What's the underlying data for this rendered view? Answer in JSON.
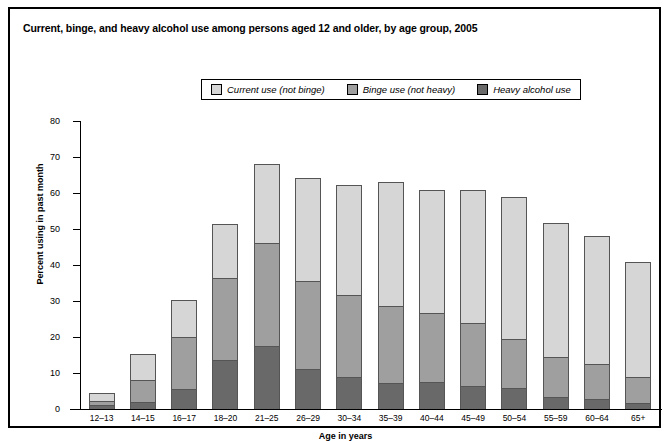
{
  "title": "Current, binge, and heavy alcohol use among persons aged 12 and older, by age group, 2005",
  "legend": {
    "entries": [
      {
        "label": "Current use (not binge)",
        "color": "#d6d6d6",
        "icon": "legend-swatch-icon"
      },
      {
        "label": "Binge use (not heavy)",
        "color": "#9f9f9f",
        "icon": "legend-swatch-icon"
      },
      {
        "label": "Heavy alcohol use",
        "color": "#696969",
        "icon": "legend-swatch-icon"
      }
    ]
  },
  "chart_data": {
    "type": "bar",
    "stacked": true,
    "title": "Current, binge, and heavy alcohol use among persons aged 12 and older, by age group, 2005",
    "xlabel": "Age in years",
    "ylabel": "Percent using in past month",
    "ylim": [
      0,
      80
    ],
    "yticks": [
      0,
      10,
      20,
      30,
      40,
      50,
      60,
      70,
      80
    ],
    "grid": false,
    "legend_position": "top-center",
    "categories": [
      "12–13",
      "14–15",
      "16–17",
      "18–20",
      "21–25",
      "26–29",
      "30–34",
      "35–39",
      "40–44",
      "45–49",
      "50–54",
      "55–59",
      "60–64",
      "65+"
    ],
    "series": [
      {
        "name": "Heavy alcohol use",
        "color": "#696969",
        "values": [
          1.1,
          2.0,
          5.6,
          13.6,
          17.4,
          11.1,
          9.0,
          7.2,
          7.6,
          6.4,
          5.9,
          3.3,
          2.7,
          1.7
        ]
      },
      {
        "name": "Binge use (not heavy)",
        "color": "#9f9f9f",
        "values": [
          1.2,
          6.0,
          14.3,
          22.8,
          28.8,
          24.4,
          22.6,
          21.3,
          19.2,
          17.5,
          13.6,
          11.2,
          9.8,
          7.1
        ]
      },
      {
        "name": "Current use (not binge)",
        "color": "#d6d6d6",
        "values": [
          1.9,
          7.1,
          10.2,
          14.7,
          21.6,
          28.5,
          30.3,
          34.3,
          33.7,
          36.7,
          39.1,
          36.8,
          35.4,
          31.7
        ]
      }
    ],
    "totals": [
      4.2,
      15.1,
      30.1,
      51.1,
      67.8,
      64.0,
      61.9,
      62.8,
      60.5,
      60.6,
      58.6,
      51.3,
      47.9,
      40.5
    ],
    "cumulative_heavy": [
      1.1,
      2.0,
      5.6,
      13.6,
      17.4,
      11.1,
      9.0,
      7.2,
      7.6,
      6.4,
      5.9,
      3.3,
      2.7,
      1.7
    ],
    "cumulative_binge_top": [
      2.3,
      8.0,
      19.9,
      36.4,
      46.2,
      35.5,
      31.6,
      28.5,
      26.8,
      23.9,
      19.5,
      14.5,
      12.5,
      8.8
    ]
  }
}
